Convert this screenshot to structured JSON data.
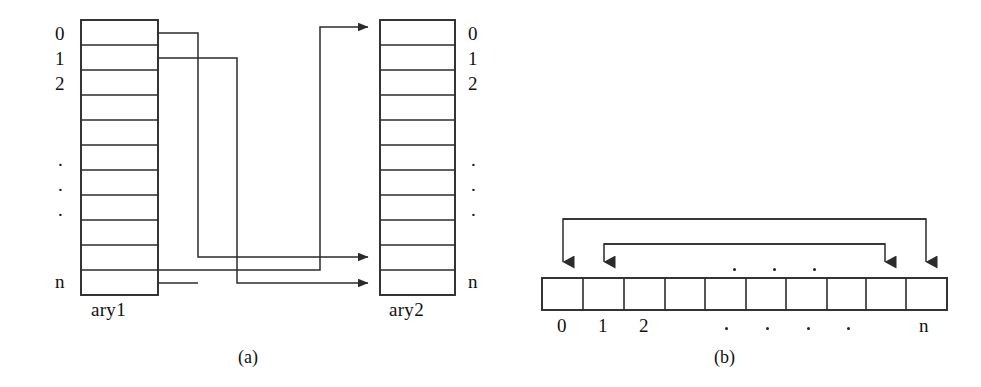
{
  "figure": {
    "background": "#ffffff",
    "ink": "#2b2b2b",
    "panels": [
      {
        "id": "panel-a",
        "caption": "(a)",
        "description": "Two vertical arrays ary1 and ary2 with cross connections reversing element order",
        "arrays": [
          {
            "name": "ary1",
            "label": "ary1",
            "orientation": "vertical",
            "cells": 11,
            "index_labels": [
              "0",
              "1",
              "2",
              "",
              "",
              "",
              ".",
              ".",
              ".",
              "",
              "n"
            ],
            "label_side": "left"
          },
          {
            "name": "ary2",
            "label": "ary2",
            "orientation": "vertical",
            "cells": 11,
            "index_labels": [
              "0",
              "1",
              "2",
              "",
              "",
              "",
              ".",
              ".",
              ".",
              "",
              "n"
            ],
            "label_side": "right"
          }
        ],
        "connections": [
          {
            "from": "ary1[0]",
            "to": "ary2[9]"
          },
          {
            "from": "ary1[1]",
            "to": "ary2[10]"
          },
          {
            "from": "ary1[9]",
            "to": "ary2[1]"
          },
          {
            "from": "ary1[10]",
            "to": "ary2[0]"
          }
        ]
      },
      {
        "id": "panel-b",
        "caption": "(b)",
        "description": "Single horizontal array with in-place swap arrows between opposite ends",
        "arrays": [
          {
            "name": "ary",
            "label": "",
            "orientation": "horizontal",
            "cells": 10,
            "index_labels": [
              "0",
              "1",
              "2",
              ".",
              ".",
              ".",
              ".",
              "",
              "",
              "n"
            ],
            "label_side": "bottom"
          }
        ],
        "connections": [
          {
            "from": "ary[0]",
            "to": "ary[9]"
          },
          {
            "from": "ary[1]",
            "to": "ary[8]"
          }
        ],
        "top_dots": 3,
        "bottom_dots": 4
      }
    ]
  },
  "labels": {
    "ary1_name": "ary1",
    "ary2_name": "ary2",
    "caption_a": "(a)",
    "caption_b": "(b)",
    "index_0": "0",
    "index_1": "1",
    "index_2": "2",
    "index_n": "n",
    "ellipsis_dot": "."
  }
}
